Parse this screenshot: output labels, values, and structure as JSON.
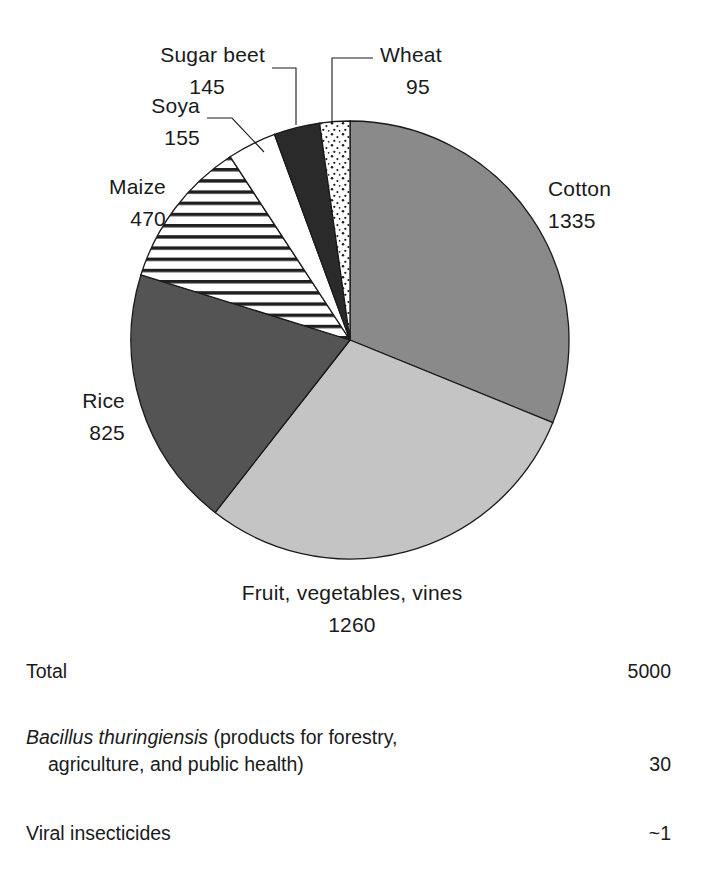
{
  "chart_data": {
    "type": "pie",
    "title": "",
    "unit_total": 5000,
    "categories": [
      "Cotton",
      "Fruit, vegetables, vines",
      "Rice",
      "Maize",
      "Soya",
      "Sugar beet",
      "Wheat"
    ],
    "values": [
      1335,
      1260,
      825,
      470,
      155,
      145,
      95
    ],
    "start_angle_deg": 0,
    "direction": "clockwise",
    "legend": "none",
    "grid": false,
    "slices": [
      {
        "name": "Cotton",
        "label": "Cotton",
        "value": 1335,
        "value_text": "1335",
        "fill": "#8a8a8a",
        "pattern": "solid-medium-gray",
        "label_x": 548,
        "label_y": 196,
        "value_x": 548,
        "value_y": 228,
        "anchor": "start",
        "leader": ""
      },
      {
        "name": "Fruit, vegetables, vines",
        "label": "Fruit, vegetables, vines",
        "value": 1260,
        "value_text": "1260",
        "fill": "#c4c4c4",
        "pattern": "solid-light-gray",
        "label_x": 352,
        "label_y": 600,
        "value_x": 352,
        "value_y": 632,
        "anchor": "middle",
        "leader": ""
      },
      {
        "name": "Rice",
        "label": "Rice",
        "value": 825,
        "value_text": "825",
        "fill": "#545454",
        "pattern": "solid-dark-gray",
        "label_x": 125,
        "label_y": 408,
        "value_x": 125,
        "value_y": 440,
        "anchor": "end",
        "leader": ""
      },
      {
        "name": "Maize",
        "label": "Maize",
        "value": 470,
        "value_text": "470",
        "fill": "url(#hatch-horizontal)",
        "pattern": "horizontal-stripes",
        "label_x": 166,
        "label_y": 194,
        "value_x": 166,
        "value_y": 226,
        "anchor": "end",
        "leader": ""
      },
      {
        "name": "Soya",
        "label": "Soya",
        "value": 155,
        "value_text": "155",
        "fill": "#ffffff",
        "pattern": "white",
        "label_x": 200,
        "label_y": 113,
        "value_x": 200,
        "value_y": 145,
        "anchor": "end",
        "leader": "M 207,118 L 232,118 L 264,152"
      },
      {
        "name": "Sugar beet",
        "label": "Sugar beet",
        "value": 145,
        "value_text": "145",
        "fill": "#2a2a2a",
        "pattern": "solid-near-black",
        "label_x": 265,
        "label_y": 62,
        "value_x": 225,
        "value_y": 94,
        "anchor": "end",
        "leader": "M 272,68 L 296,68 L 296,125"
      },
      {
        "name": "Wheat",
        "label": "Wheat",
        "value": 95,
        "value_text": "95",
        "fill": "url(#dots-speckle)",
        "pattern": "speckled-dots",
        "label_x": 380,
        "label_y": 62,
        "value_x": 406,
        "value_y": 94,
        "anchor": "start",
        "leader": "M 373,58 L 332,58 L 332,123"
      }
    ],
    "geometry": {
      "cx": 350,
      "cy": 340,
      "r": 219
    },
    "colors": {
      "cotton": "#8a8a8a",
      "fruit_vegetables_vines": "#c4c4c4",
      "rice": "#545454",
      "sugar_beet": "#2a2a2a",
      "soya": "#ffffff",
      "outline": "#1a1a1a"
    }
  },
  "summary": {
    "rows": [
      {
        "label": "Total",
        "value": "5000"
      },
      {
        "label_italic": "Bacillus thuringiensis",
        "label_rest": " (products for forestry,",
        "label_line2": "agriculture, and public health)",
        "value": "30"
      },
      {
        "label": "Viral insecticides",
        "value": "~1"
      }
    ]
  }
}
